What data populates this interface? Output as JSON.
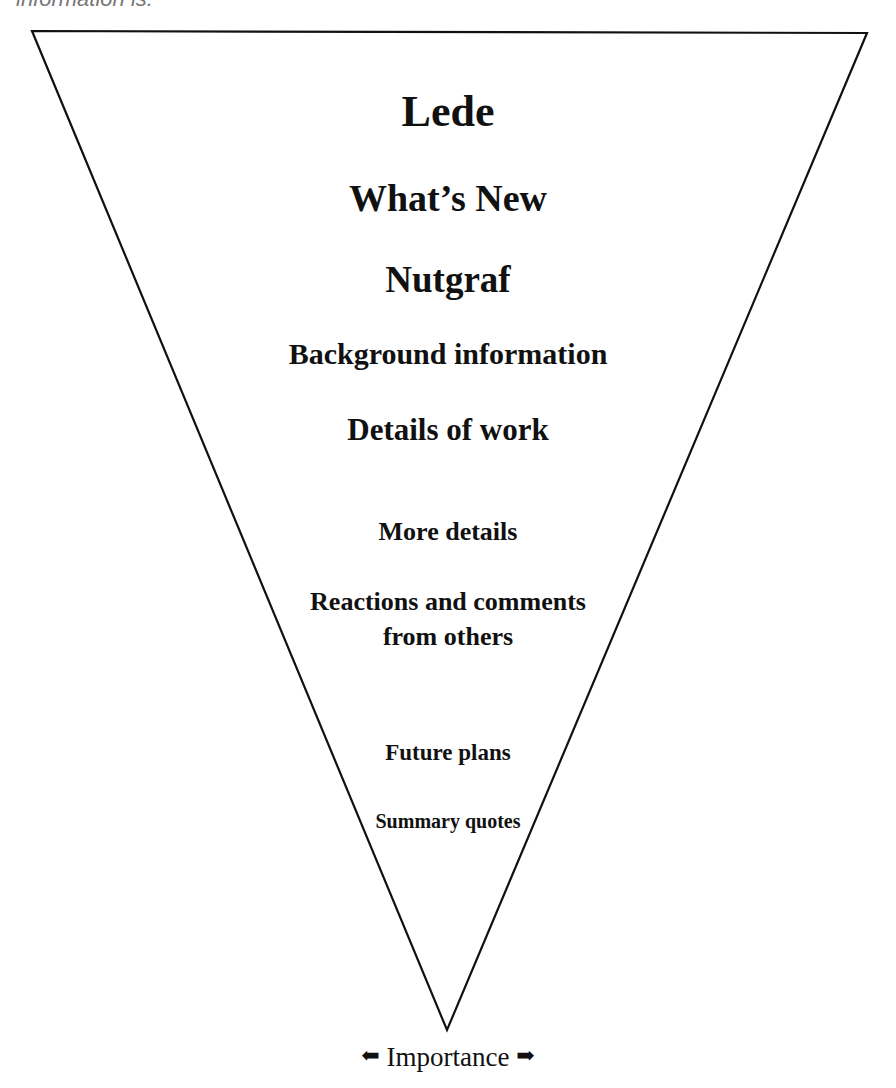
{
  "header": {
    "clipped_text": "information is:"
  },
  "diagram": {
    "shape": "inverted-triangle",
    "stroke_color": "#111111",
    "levels": [
      {
        "label": "Lede"
      },
      {
        "label": "What’s New"
      },
      {
        "label": "Nutgraf"
      },
      {
        "label": "Background information"
      },
      {
        "label": "Details of work"
      },
      {
        "label": "More details"
      },
      {
        "label": "Reactions and comments from others"
      },
      {
        "label": "Future plans"
      },
      {
        "label": "Summary quotes"
      }
    ],
    "axis": {
      "label": "Importance",
      "left_arrow": "⬅",
      "right_arrow": "➡"
    }
  }
}
